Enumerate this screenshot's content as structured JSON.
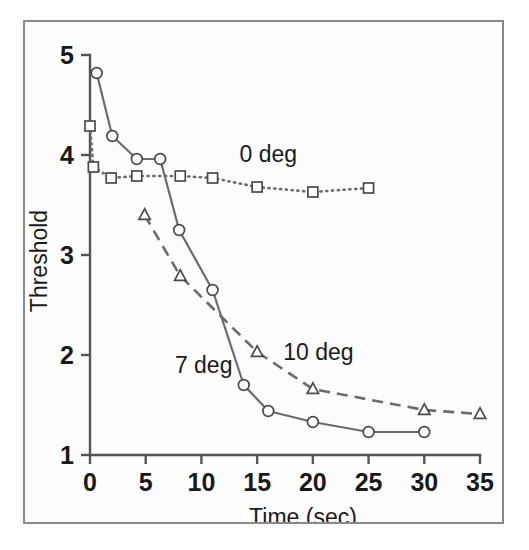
{
  "figure": {
    "frame_border_color": "#8a8a8a",
    "background_color": "#fdfdfd",
    "line_color": "#6b6b6b",
    "axis_color": "#545454",
    "text_color": "#1a1a1a"
  },
  "axes": {
    "x_title": "Time (sec)",
    "y_title": "Threshold",
    "x_ticks": [
      "0",
      "5",
      "10",
      "15",
      "20",
      "25",
      "30",
      "35"
    ],
    "y_ticks": [
      "5",
      "4",
      "3",
      "2",
      "1"
    ]
  },
  "annotations": {
    "series_0deg": "0 deg",
    "series_7deg": "7 deg",
    "series_10deg": "10 deg"
  },
  "chart_data": {
    "type": "line",
    "title": "",
    "xlabel": "Time (sec)",
    "ylabel": "Threshold",
    "xlim": [
      0,
      35
    ],
    "ylim": [
      1,
      5
    ],
    "xticks": [
      0,
      5,
      10,
      15,
      20,
      25,
      30,
      35
    ],
    "yticks": [
      1,
      2,
      3,
      4,
      5
    ],
    "grid": false,
    "legend": "inline-annotations",
    "series": [
      {
        "name": "0 deg",
        "marker": "square",
        "linestyle": "dotted",
        "label_position": {
          "x": 16.0,
          "y": 3.93
        },
        "points": [
          {
            "x": 0.0,
            "y": 4.29
          },
          {
            "x": 0.3,
            "y": 3.88
          },
          {
            "x": 1.9,
            "y": 3.77
          },
          {
            "x": 4.2,
            "y": 3.79
          },
          {
            "x": 8.1,
            "y": 3.79
          },
          {
            "x": 11.0,
            "y": 3.77
          },
          {
            "x": 15.0,
            "y": 3.68
          },
          {
            "x": 20.0,
            "y": 3.63
          },
          {
            "x": 25.0,
            "y": 3.67
          }
        ]
      },
      {
        "name": "7 deg",
        "marker": "circle",
        "linestyle": "solid",
        "label_position": {
          "x": 10.2,
          "y": 1.82
        },
        "points": [
          {
            "x": 0.6,
            "y": 4.82
          },
          {
            "x": 2.0,
            "y": 4.19
          },
          {
            "x": 4.2,
            "y": 3.96
          },
          {
            "x": 6.3,
            "y": 3.96
          },
          {
            "x": 8.0,
            "y": 3.25
          },
          {
            "x": 11.0,
            "y": 2.65
          },
          {
            "x": 13.8,
            "y": 1.7
          },
          {
            "x": 16.0,
            "y": 1.44
          },
          {
            "x": 20.0,
            "y": 1.33
          },
          {
            "x": 25.0,
            "y": 1.23
          },
          {
            "x": 30.0,
            "y": 1.23
          }
        ]
      },
      {
        "name": "10 deg",
        "marker": "triangle",
        "linestyle": "dashed",
        "label_position": {
          "x": 20.5,
          "y": 1.95
        },
        "points": [
          {
            "x": 4.9,
            "y": 3.4
          },
          {
            "x": 8.1,
            "y": 2.79
          },
          {
            "x": 15.0,
            "y": 2.03
          },
          {
            "x": 20.0,
            "y": 1.66
          },
          {
            "x": 30.0,
            "y": 1.45
          },
          {
            "x": 35.0,
            "y": 1.41
          }
        ]
      }
    ]
  }
}
